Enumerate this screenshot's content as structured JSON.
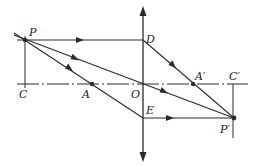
{
  "diagram": {
    "type": "thin-lens ray diagram",
    "labels": {
      "P": "P",
      "C": "C",
      "A": "A",
      "O": "O",
      "D": "D",
      "E": "E",
      "A_prime": "A′",
      "C_prime": "C′",
      "P_prime": "P′"
    },
    "points": {
      "P": [
        25,
        40
      ],
      "C": [
        25,
        84
      ],
      "A": [
        92,
        84
      ],
      "O": [
        143,
        84
      ],
      "D": [
        143,
        40
      ],
      "E": [
        143,
        118
      ],
      "A_prime": [
        193,
        84
      ],
      "C_prime": [
        233,
        84
      ],
      "P_prime": [
        234,
        118
      ]
    },
    "colors": {
      "line": "#2a2a2a",
      "background": "#ffffff"
    }
  }
}
